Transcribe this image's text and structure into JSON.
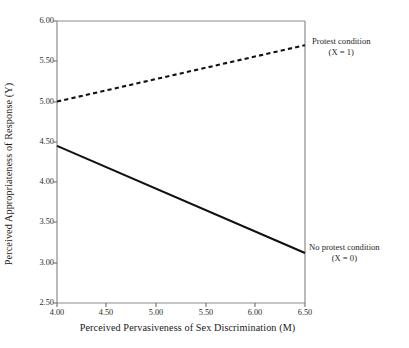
{
  "chart_data": {
    "type": "line",
    "title": "",
    "xlabel": "Perceived Pervasiveness of Sex Discrimination (M)",
    "ylabel": "Perceived Appropriateness of Response (Y)",
    "xlim": [
      4.0,
      6.5
    ],
    "ylim": [
      2.5,
      6.0
    ],
    "xticks": [
      "4.00",
      "4.50",
      "5.00",
      "5.50",
      "6.00",
      "6.50"
    ],
    "xtick_values": [
      4.0,
      4.5,
      5.0,
      5.5,
      6.0,
      6.5
    ],
    "yticks": [
      "2.50",
      "3.00",
      "3.50",
      "4.00",
      "4.50",
      "5.00",
      "5.50",
      "6.00"
    ],
    "ytick_values": [
      2.5,
      3.0,
      3.5,
      4.0,
      4.5,
      5.0,
      5.5,
      6.0
    ],
    "grid": false,
    "legend_position": "right-inline-annotations",
    "series": [
      {
        "name": "Protest condition (X = 1)",
        "style": "dashed",
        "color": "#111111",
        "x": [
          4.0,
          6.5
        ],
        "values": [
          5.0,
          5.7
        ],
        "annotation_line1": "Protest condition",
        "annotation_line2": "(X = 1)"
      },
      {
        "name": "No protest condition (X = 0)",
        "style": "solid",
        "color": "#111111",
        "x": [
          4.0,
          6.5
        ],
        "values": [
          4.45,
          3.12
        ],
        "annotation_line1": "No protest condition",
        "annotation_line2": "(X = 0)"
      }
    ]
  },
  "axes": {
    "frame_color": "#8c8c8c",
    "tick_color": "#6e6e6e"
  }
}
